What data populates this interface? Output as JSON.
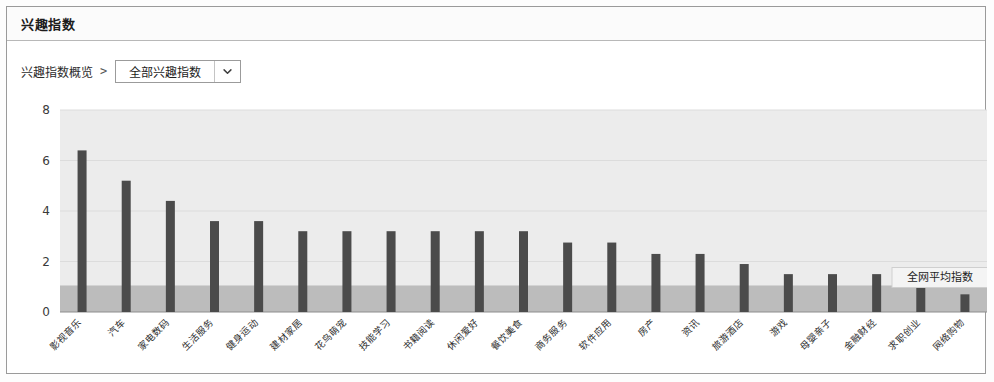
{
  "header": {
    "title": "兴趣指数"
  },
  "breadcrumb": {
    "root_label": "兴趣指数概览",
    "separator": ">"
  },
  "category_select": {
    "selected": "全部兴趣指数",
    "arrow_icon": "chevron-down-icon"
  },
  "chart_data": {
    "type": "bar",
    "title": "兴趣指数",
    "xlabel": "",
    "ylabel": "",
    "ylim": [
      0,
      8
    ],
    "yticks": [
      0,
      2,
      4,
      6,
      8
    ],
    "ytick_labels": [
      "0",
      "2",
      "4",
      "6",
      "8"
    ],
    "grid": true,
    "legend_position": "none",
    "bar_color": "#4b4b4b",
    "plot_bg_color": "#ececec",
    "reference_band": {
      "label": "全网平均指数",
      "value": 1.05,
      "color": "#bcbcbc"
    },
    "categories": [
      "影视音乐",
      "汽车",
      "家电数码",
      "生活服务",
      "健身运动",
      "建材家居",
      "花鸟萌宠",
      "技能学习",
      "书籍阅读",
      "休闲爱好",
      "餐饮美食",
      "商务服务",
      "软件应用",
      "房产",
      "资讯",
      "旅游酒店",
      "游戏",
      "母婴亲子",
      "金融财经",
      "求职创业",
      "网络购物"
    ],
    "values": [
      6.4,
      5.2,
      4.4,
      3.6,
      3.6,
      3.2,
      3.2,
      3.2,
      3.2,
      3.2,
      3.2,
      2.75,
      2.75,
      2.3,
      2.3,
      1.9,
      1.5,
      1.5,
      1.5,
      1.1,
      0.7
    ]
  }
}
